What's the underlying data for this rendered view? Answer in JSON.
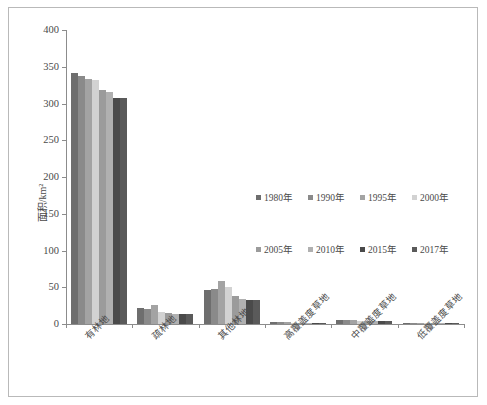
{
  "chart_data": {
    "type": "bar",
    "title": "",
    "xlabel": "",
    "ylabel": "面积/km²",
    "ylim": [
      0,
      400
    ],
    "yticks": [
      0,
      50,
      100,
      150,
      200,
      250,
      300,
      350,
      400
    ],
    "grid": false,
    "legend_position": "center-right",
    "categories": [
      "有林地",
      "疏林地",
      "其他林地",
      "高覆盖度草地",
      "中覆盖度草地",
      "低覆盖度草地"
    ],
    "series": [
      {
        "name": "1980年",
        "color": "#6e6e6e",
        "values": [
          342,
          22,
          46,
          2.5,
          5.5,
          2.0
        ]
      },
      {
        "name": "1990年",
        "color": "#8a8a8a",
        "values": [
          338,
          21,
          47,
          2.5,
          5.5,
          2.0
        ]
      },
      {
        "name": "1995年",
        "color": "#a3a3a3",
        "values": [
          333,
          26,
          58,
          2.5,
          5.0,
          2.0
        ]
      },
      {
        "name": "2000年",
        "color": "#d2d2d2",
        "values": [
          332,
          17,
          50,
          2.0,
          4.5,
          1.5
        ]
      },
      {
        "name": "2005年",
        "color": "#9b9b9b",
        "values": [
          318,
          15,
          38,
          2.0,
          4.0,
          1.5
        ]
      },
      {
        "name": "2010年",
        "color": "#b0b0b0",
        "values": [
          316,
          14,
          34,
          2.0,
          4.0,
          1.5
        ]
      },
      {
        "name": "2015年",
        "color": "#4a4a4a",
        "values": [
          307,
          14,
          32,
          1.5,
          3.5,
          1.5
        ]
      },
      {
        "name": "2017年",
        "color": "#5a5a5a",
        "values": [
          307,
          14,
          32,
          1.5,
          3.5,
          1.5
        ]
      }
    ]
  }
}
